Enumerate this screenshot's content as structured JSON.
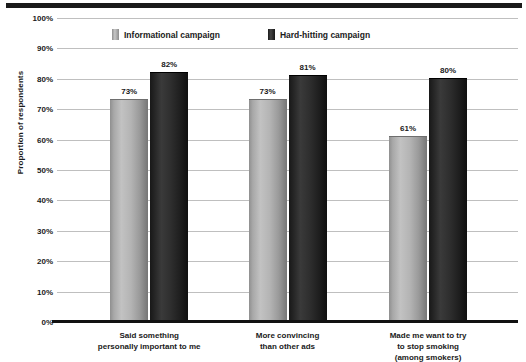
{
  "chart_data": {
    "type": "bar",
    "title": "",
    "xlabel": "",
    "ylabel": "Proportion of respondents",
    "ylim": [
      0,
      100
    ],
    "ytick_labels": [
      "100%",
      "90%",
      "80%",
      "70%",
      "60%",
      "50%",
      "40%",
      "30%",
      "20%",
      "10%",
      "0%"
    ],
    "ytick_values": [
      100,
      90,
      80,
      70,
      60,
      50,
      40,
      30,
      20,
      10,
      0
    ],
    "grid": true,
    "legend_position": "top-center",
    "categories": [
      "Said something\npersonally important to me",
      "More convincing\nthan other ads",
      "Made me want to try\nto stop smoking\n(among smokers)"
    ],
    "series": [
      {
        "name": "Informational campaign",
        "color": "#b4b4b4",
        "values": [
          73,
          73,
          61
        ],
        "value_labels": [
          "73%",
          "73%",
          "61%"
        ]
      },
      {
        "name": "Hard-hitting campaign",
        "color": "#262626",
        "values": [
          82,
          81,
          80
        ],
        "value_labels": [
          "82%",
          "81%",
          "80%"
        ]
      }
    ]
  },
  "legend": {
    "items": [
      {
        "label": "Informational campaign",
        "swatch": "light"
      },
      {
        "label": "Hard-hitting campaign",
        "swatch": "dark"
      }
    ]
  }
}
